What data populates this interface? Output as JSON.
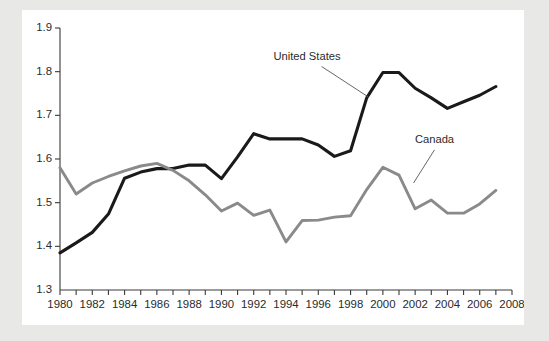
{
  "chart_data": {
    "type": "line",
    "title": "",
    "subtitle": "",
    "xlabel": "",
    "ylabel": "",
    "xlim": [
      1980,
      2008
    ],
    "ylim": [
      1.3,
      1.9
    ],
    "yticks": [
      "1.3",
      "1.4",
      "1.5",
      "1.6",
      "1.7",
      "1.8",
      "1.9"
    ],
    "ytick_values": [
      1.3,
      1.4,
      1.5,
      1.6,
      1.7,
      1.8,
      1.9
    ],
    "xticks": [
      "1980",
      "1982",
      "1984",
      "1986",
      "1988",
      "1990",
      "1992",
      "1994",
      "1996",
      "1998",
      "2000",
      "2002",
      "2004",
      "2006",
      "2008"
    ],
    "xtick_values": [
      1980,
      1982,
      1984,
      1986,
      1988,
      1990,
      1992,
      1994,
      1996,
      1998,
      2000,
      2002,
      2004,
      2006,
      2008
    ],
    "minor_xtick_interval": 1,
    "grid": false,
    "legend_position": "inline-annotations",
    "x": [
      1980,
      1981,
      1982,
      1983,
      1984,
      1985,
      1986,
      1987,
      1988,
      1989,
      1990,
      1991,
      1992,
      1993,
      1994,
      1995,
      1996,
      1997,
      1998,
      1999,
      2000,
      2001,
      2002,
      2003,
      2004,
      2005,
      2006,
      2007
    ],
    "series": [
      {
        "name": "United States",
        "color": "#1a1a1a",
        "values": [
          1.385,
          1.408,
          1.432,
          1.474,
          1.556,
          1.57,
          1.578,
          1.578,
          1.586,
          1.586,
          1.555,
          1.605,
          1.658,
          1.646,
          1.646,
          1.646,
          1.632,
          1.606,
          1.619,
          1.74,
          1.798,
          1.798,
          1.762,
          1.74,
          1.716,
          1.731,
          1.746,
          1.766
        ]
      },
      {
        "name": "Canada",
        "color": "#8a8a8a",
        "values": [
          1.58,
          1.52,
          1.545,
          1.56,
          1.573,
          1.584,
          1.59,
          1.574,
          1.55,
          1.518,
          1.481,
          1.499,
          1.471,
          1.483,
          1.41,
          1.459,
          1.46,
          1.467,
          1.47,
          1.53,
          1.581,
          1.563,
          1.486,
          1.506,
          1.476,
          1.476,
          1.497,
          1.528
        ]
      }
    ],
    "annotations": [
      {
        "label": "United States",
        "text_x": 1995.3,
        "text_y": 1.826,
        "leader_from_x": 1996.2,
        "leader_from_y": 1.812,
        "leader_to_x": 1999.1,
        "leader_to_y": 1.742
      },
      {
        "label": "Canada",
        "text_x": 2003.2,
        "text_y": 1.636,
        "leader_from_x": 2003.2,
        "leader_from_y": 1.621,
        "leader_to_x": 2001.9,
        "leader_to_y": 1.545
      }
    ]
  },
  "colors": {
    "page_background": "#e8e8e6",
    "card_background": "#ffffff",
    "axis": "#3a3a3a",
    "united_states": "#1a1a1a",
    "canada": "#8a8a8a"
  }
}
